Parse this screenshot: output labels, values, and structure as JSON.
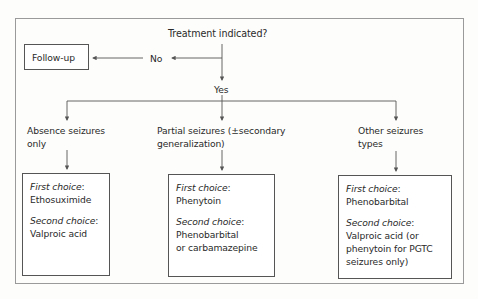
{
  "diagram": {
    "type": "flowchart",
    "root": {
      "label": "Treatment indicated?"
    },
    "no_branch": {
      "label": "No",
      "target": "Follow-up"
    },
    "yes_branch": {
      "label": "Yes"
    },
    "categories": [
      {
        "label_line1": "Absence seizures",
        "label_line2": "only",
        "first_choice_label": "First choice",
        "first_choice": [
          "Ethosuximide"
        ],
        "second_choice_label": "Second choice",
        "second_choice": [
          "Valproic acid"
        ]
      },
      {
        "label_line1": "Partial seizures (±secondary",
        "label_line2": "generalization)",
        "first_choice_label": "First choice",
        "first_choice": [
          "Phenytoin"
        ],
        "second_choice_label": "Second choice",
        "second_choice": [
          "Phenobarbital",
          "or carbamazepine"
        ]
      },
      {
        "label_line1": "Other seizures",
        "label_line2": "types",
        "first_choice_label": "First choice",
        "first_choice": [
          "Phenobarbital"
        ],
        "second_choice_label": "Second choice",
        "second_choice": [
          "Valproic acid (or",
          "phenytoin for PGTC",
          "seizures only)"
        ]
      }
    ]
  },
  "colors": {
    "line": "#555555",
    "frame": "#9a9a9a",
    "text": "#2a2a2a"
  }
}
